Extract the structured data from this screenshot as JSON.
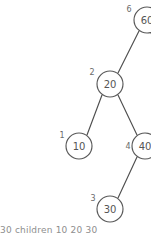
{
  "diagram": {
    "type": "tree",
    "title": "",
    "background_color": "#ffffff",
    "node_stroke_color": "#585858",
    "node_fill_color": "#ffffff",
    "edge_color": "#4f4f4f",
    "value_text_color": "#555555",
    "index_text_color": "#6a6a6a",
    "node_radius": 13,
    "nodes": [
      {
        "id": "n6",
        "value": "60",
        "index_label": "6",
        "cx": 147,
        "cy": 20,
        "index_x": 129,
        "index_y": 9,
        "clipped": "right"
      },
      {
        "id": "n2",
        "value": "20",
        "index_label": "2",
        "cx": 110,
        "cy": 84,
        "index_x": 92,
        "index_y": 72,
        "clipped": "none"
      },
      {
        "id": "n1",
        "value": "10",
        "index_label": "1",
        "cx": 79,
        "cy": 146,
        "index_x": 62,
        "index_y": 135,
        "clipped": "none"
      },
      {
        "id": "n4",
        "value": "40",
        "index_label": "4",
        "cx": 145,
        "cy": 146,
        "index_x": 128,
        "index_y": 146,
        "clipped": "right"
      },
      {
        "id": "n3",
        "value": "30",
        "index_label": "3",
        "cx": 110,
        "cy": 209,
        "index_x": 93,
        "index_y": 198,
        "clipped": "none"
      }
    ],
    "edges": [
      {
        "id": "e-60-20",
        "from": "n6",
        "to": "n2",
        "x1": 139,
        "y1": 31,
        "x2": 118,
        "y2": 73
      },
      {
        "id": "e-20-10",
        "from": "n2",
        "to": "n1",
        "x1": 102,
        "y1": 95,
        "x2": 87,
        "y2": 135
      },
      {
        "id": "e-20-40",
        "from": "n2",
        "to": "n4",
        "x1": 118,
        "y1": 95,
        "x2": 137,
        "y2": 135
      },
      {
        "id": "e-40-30",
        "from": "n4",
        "to": "n3",
        "x1": 137,
        "y1": 157,
        "x2": 118,
        "y2": 198
      },
      {
        "id": "e-60-stub-right",
        "from": "n6",
        "to": null,
        "x1": 151,
        "y1": 33,
        "x2": 158,
        "y2": 48
      },
      {
        "id": "e-40-stub-right",
        "from": "n4",
        "to": null,
        "x1": 151,
        "y1": 157,
        "x2": 158,
        "y2": 172
      }
    ]
  },
  "caption": {
    "text": "30 children 10 20 30"
  }
}
